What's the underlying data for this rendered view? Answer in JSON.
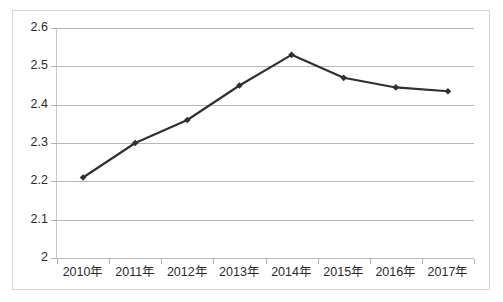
{
  "chart_data": {
    "type": "line",
    "title": "",
    "subtitle": "",
    "xlabel": "",
    "ylabel": "",
    "categories": [
      "2010年",
      "2011年",
      "2012年",
      "2013年",
      "2014年",
      "2015年",
      "2016年",
      "2017年"
    ],
    "values": [
      2.21,
      2.3,
      2.36,
      2.45,
      2.53,
      2.47,
      2.445,
      2.435
    ],
    "series": [
      {
        "name": "",
        "values": [
          2.21,
          2.3,
          2.36,
          2.45,
          2.53,
          2.47,
          2.445,
          2.435
        ]
      }
    ],
    "ylim": [
      2,
      2.6
    ],
    "ytick_labels": [
      "2.6",
      "2.5",
      "2.4",
      "2.3",
      "2.2",
      "2.1",
      "2"
    ],
    "ytick_values": [
      2.6,
      2.5,
      2.4,
      2.3,
      2.2,
      2.1,
      2.0
    ],
    "grid": true,
    "grid_axis": "y",
    "legend": false,
    "legend_position": "none",
    "annotations": [],
    "marker": "diamond"
  },
  "style": {
    "line_color": "#2f2f2f",
    "marker_color": "#2f2f2f",
    "grid_color": "#b8b8b8",
    "axis_color": "#b0b0b0",
    "text_color": "#2b2b2b",
    "frame_color": "#d4d4d4",
    "background": "#ffffff"
  },
  "axis_labels": {
    "y": [
      "2.6",
      "2.5",
      "2.4",
      "2.3",
      "2.2",
      "2.1",
      "2"
    ],
    "x": [
      "2010年",
      "2011年",
      "2012年",
      "2013年",
      "2014年",
      "2015年",
      "2016年",
      "2017年"
    ]
  }
}
